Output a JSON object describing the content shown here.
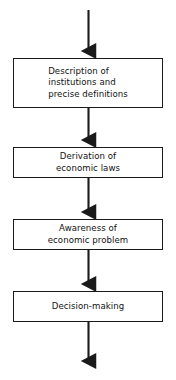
{
  "diagram": {
    "type": "flowchart",
    "orientation": "vertical-top-to-bottom",
    "background_color": "#ffffff",
    "stroke_color": "#1a1a1a",
    "text_color": "#111111",
    "nodes": [
      {
        "id": "box-1",
        "shape": "rectangle",
        "label": "Description of\ninstitutions and\nprecise definitions",
        "align": "left"
      },
      {
        "id": "box-2",
        "shape": "rectangle",
        "label": "Derivation of\neconomic laws",
        "align": "center"
      },
      {
        "id": "box-3",
        "shape": "rectangle",
        "label": "Awareness of\neconomic problem",
        "align": "center"
      },
      {
        "id": "box-4",
        "shape": "rectangle",
        "label": "Decision-making",
        "align": "center"
      }
    ],
    "connectors": [
      {
        "id": "arrow-entry",
        "from": "start",
        "to": "box-1",
        "style": "solid-arrow"
      },
      {
        "id": "arrow-1-to-2",
        "from": "box-1",
        "to": "box-2",
        "style": "solid-arrow"
      },
      {
        "id": "arrow-2-to-3",
        "from": "box-2",
        "to": "box-3",
        "style": "solid-arrow"
      },
      {
        "id": "arrow-3-to-4",
        "from": "box-3",
        "to": "box-4",
        "style": "solid-arrow"
      },
      {
        "id": "arrow-exit",
        "from": "box-4",
        "to": "end",
        "style": "solid-arrow"
      }
    ]
  }
}
